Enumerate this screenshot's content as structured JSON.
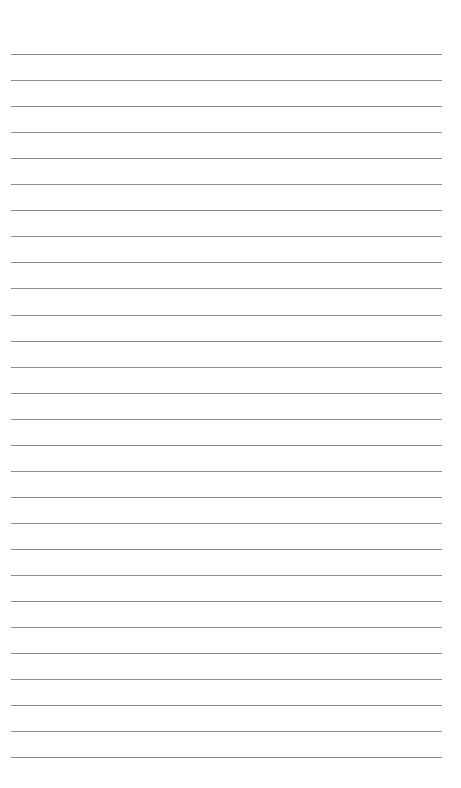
{
  "page": {
    "type": "ruled-sheet",
    "background_color": "#ffffff",
    "line_color": "#8c8c8c",
    "line_count": 28,
    "line_left": 11,
    "line_right": 442,
    "first_line_y": 54,
    "line_spacing": 26.05,
    "lines": []
  }
}
